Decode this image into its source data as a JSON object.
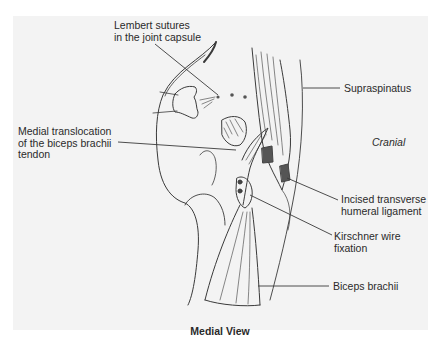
{
  "figure": {
    "caption": "Medial View",
    "orientation_label": "Cranial",
    "colors": {
      "page_background": "#ffffff",
      "panel_background": "#f3f3f3",
      "ink": "#3a3a3a",
      "label_text": "#2a2a2a"
    },
    "labels": [
      {
        "id": "lembert",
        "line1": "Lembert sutures",
        "line2": "in the joint capsule"
      },
      {
        "id": "medial",
        "line1": "Medial translocation",
        "line2": "of the biceps brachii",
        "line3": "tendon"
      },
      {
        "id": "supraspinatus",
        "line1": "Supraspinatus"
      },
      {
        "id": "incised",
        "line1": "Incised transverse",
        "line2": "humeral ligament"
      },
      {
        "id": "kirschner",
        "line1": "Kirschner wire",
        "line2": "fixation"
      },
      {
        "id": "biceps",
        "line1": "Biceps brachii"
      }
    ]
  }
}
